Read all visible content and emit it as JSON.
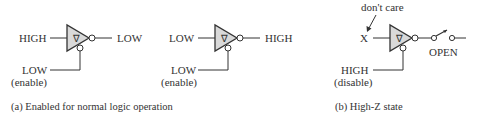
{
  "panel_a": {
    "caption": "(a) Enabled for normal logic operation",
    "gate1": {
      "input": "HIGH",
      "output": "LOW",
      "enable_value": "LOW",
      "enable_note": "(enable)",
      "symbol": "∇"
    },
    "gate2": {
      "input": "LOW",
      "output": "HIGH",
      "enable_value": "LOW",
      "enable_note": "(enable)",
      "symbol": "∇"
    }
  },
  "panel_b": {
    "caption": "(b) High-Z state",
    "gate3": {
      "input": "X",
      "input_note": "don't care",
      "switch_label": "OPEN",
      "enable_value": "HIGH",
      "enable_note": "(disable)",
      "symbol": "∇"
    }
  },
  "colors": {
    "gate_fill": "#d9d9d9",
    "stroke": "#333333",
    "text": "#333333"
  }
}
